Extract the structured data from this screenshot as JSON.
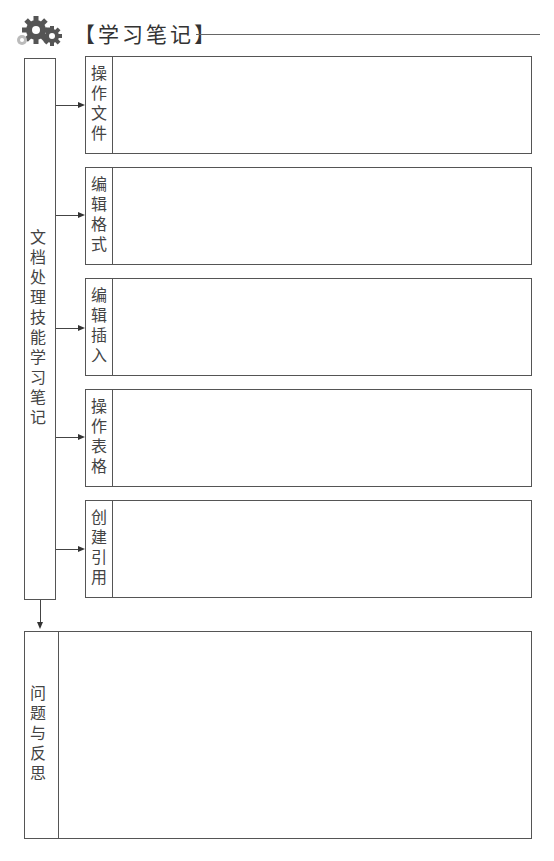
{
  "header": {
    "icon": "gears-icon",
    "title": "【学习笔记】"
  },
  "main_column": {
    "label": "文档处理技能学习笔记"
  },
  "sections": [
    {
      "label": "操作文件",
      "content": ""
    },
    {
      "label": "编辑格式",
      "content": ""
    },
    {
      "label": "编辑插入",
      "content": ""
    },
    {
      "label": "操作表格",
      "content": ""
    },
    {
      "label": "创建引用",
      "content": ""
    }
  ],
  "reflection": {
    "label": "问题与反思",
    "content": ""
  },
  "colors": {
    "gear_dark": "#555555",
    "gear_light": "#bbbbbb",
    "border": "#555555"
  }
}
